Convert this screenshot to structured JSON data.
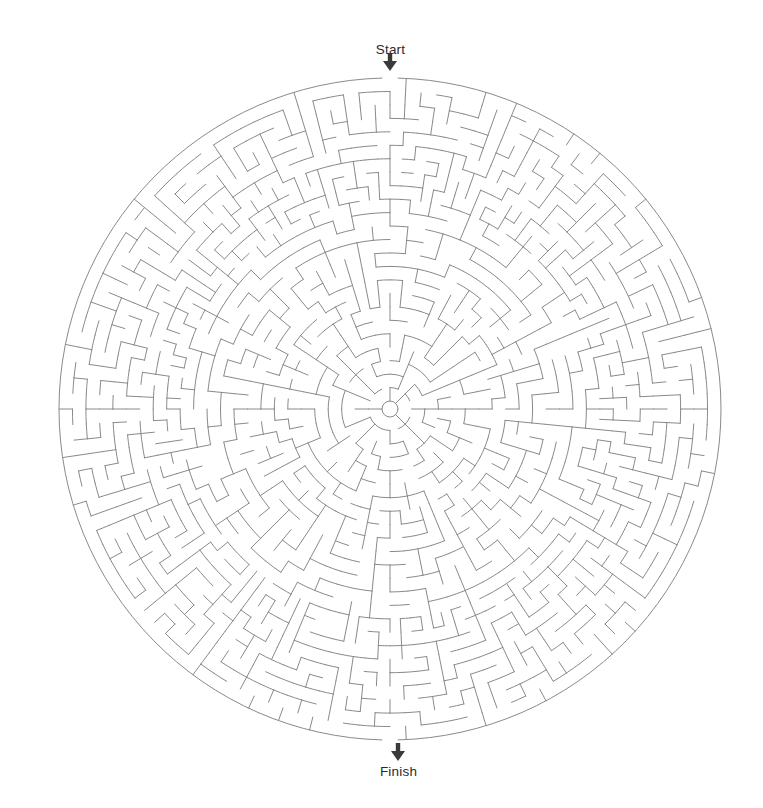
{
  "page": {
    "background_color": "#ffffff",
    "width": 763,
    "height": 808
  },
  "maze": {
    "type": "circular-theta-maze",
    "title": "",
    "center_x": 390,
    "center_y": 409,
    "outer_radius": 331,
    "hub_radius": 8,
    "ring_count": 24,
    "ring_spacing": 13.5,
    "wall_color": "#8a8a8a",
    "wall_width": 1,
    "background_color": "#ffffff",
    "start_opening_angle_deg": -90,
    "finish_opening_angle_deg": 90,
    "seed": 20240517
  },
  "labels": {
    "start": "Start",
    "finish": "Finish",
    "text_color": "#2b2b2b",
    "font_size_px": 13.5
  },
  "markers": {
    "start_arrow": {
      "name": "down-arrow-icon",
      "x": 390,
      "y": 62,
      "color": "#3a3a3a",
      "direction": "down"
    },
    "finish_arrow": {
      "name": "down-arrow-icon",
      "x": 398,
      "y": 752,
      "color": "#3a3a3a",
      "direction": "down"
    }
  }
}
